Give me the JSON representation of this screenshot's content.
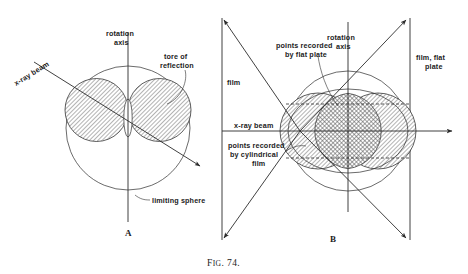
{
  "figure": {
    "caption_prefix": "F",
    "caption_smallcaps": "IG",
    "caption_number": ". 74.",
    "caption_full": "FIG. 74.",
    "panel_a": {
      "letter": "A",
      "labels": {
        "rotation_axis_line1": "rotation",
        "rotation_axis_line2": "axis",
        "xray_beam": "x-ray beam",
        "tore_line1": "tore of",
        "tore_line2": "reflection",
        "limiting_sphere": "limiting sphere"
      }
    },
    "panel_b": {
      "letter": "B",
      "labels": {
        "rotation_axis_line1": "rotation",
        "rotation_axis_line2": "axis",
        "film": "film",
        "film_flat_plate_line1": "film, flat",
        "film_flat_plate_line2": "plate",
        "xray_beam": "x-ray beam",
        "flat_plate_line1": "points recorded",
        "flat_plate_line2": "by flat plate",
        "cyl_line1": "points recorded",
        "cyl_line2": "by cylindrical",
        "cyl_line3": "film"
      }
    },
    "colors": {
      "ink": "#2b2b2b",
      "hatch": "#5a5a5a",
      "background": "#ffffff",
      "hatch_fill_light": "#c9c9c9",
      "hatch_fill_dark": "#9a9a9a"
    }
  }
}
